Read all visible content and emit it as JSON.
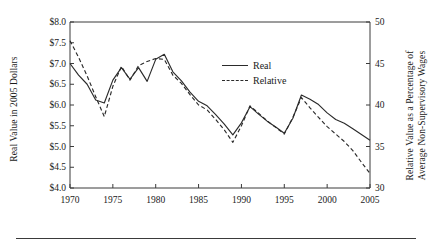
{
  "chart_data": {
    "type": "line",
    "title": "",
    "xlabel": "",
    "ylabel": "Real Value in 2005 Dollars",
    "ylabel_right": "Relative Value as a Percentage of Average Non-Supervisory Wages",
    "xlim": [
      1970,
      2005
    ],
    "ylim": [
      4.0,
      8.0
    ],
    "ylim_right": [
      30,
      50
    ],
    "grid": false,
    "legend_position": "upper-right-inside",
    "y_ticks_left": [
      "$8.0",
      "$7.5",
      "$7.0",
      "$6.5",
      "$6.0",
      "$5.5",
      "$5.0",
      "$4.5",
      "$4.0"
    ],
    "y_tick_values_left": [
      8.0,
      7.5,
      7.0,
      6.5,
      6.0,
      5.5,
      5.0,
      4.5,
      4.0
    ],
    "y_ticks_right": [
      "50",
      "45",
      "40",
      "35",
      "30"
    ],
    "y_tick_values_right": [
      50,
      45,
      40,
      35,
      30
    ],
    "x_ticks": [
      "1970",
      "1975",
      "1980",
      "1985",
      "1990",
      "1995",
      "2000",
      "2005"
    ],
    "x_tick_values": [
      1970,
      1975,
      1980,
      1985,
      1990,
      1995,
      2000,
      2005
    ],
    "x": [
      1970,
      1971,
      1972,
      1973,
      1974,
      1975,
      1976,
      1977,
      1978,
      1979,
      1980,
      1981,
      1982,
      1983,
      1984,
      1985,
      1986,
      1987,
      1988,
      1989,
      1990,
      1991,
      1992,
      1993,
      1994,
      1995,
      1996,
      1997,
      1998,
      1999,
      2000,
      2001,
      2002,
      2003,
      2004,
      2005
    ],
    "series": [
      {
        "name": "Real",
        "style": "solid",
        "axis": "left",
        "values": [
          7.0,
          6.72,
          6.5,
          6.12,
          6.05,
          6.6,
          6.9,
          6.62,
          6.9,
          6.57,
          7.1,
          7.22,
          6.8,
          6.58,
          6.31,
          6.09,
          5.98,
          5.77,
          5.54,
          5.28,
          5.57,
          5.96,
          5.78,
          5.61,
          5.47,
          5.32,
          5.68,
          6.24,
          6.14,
          6.01,
          5.81,
          5.65,
          5.56,
          5.43,
          5.29,
          5.15
        ]
      },
      {
        "name": "Relative",
        "style": "dashed",
        "axis": "left",
        "values": [
          7.55,
          7.15,
          6.7,
          6.2,
          5.72,
          6.45,
          6.93,
          6.6,
          6.95,
          7.05,
          7.12,
          7.1,
          6.72,
          6.52,
          6.25,
          6.0,
          5.88,
          5.65,
          5.4,
          5.1,
          5.5,
          5.98,
          5.8,
          5.62,
          5.46,
          5.3,
          5.7,
          6.18,
          5.93,
          5.7,
          5.48,
          5.3,
          5.12,
          4.9,
          4.62,
          4.35
        ]
      }
    ],
    "series_right_values": {
      "note_axis_mapping": "right axis 30-50 maps linearly onto left axis 4.0-8.0",
      "Real": [
        45.0,
        43.6,
        42.5,
        40.6,
        40.3,
        43.0,
        44.5,
        43.1,
        44.5,
        42.9,
        45.5,
        46.1,
        44.0,
        42.9,
        41.6,
        40.5,
        39.9,
        38.9,
        37.7,
        36.4,
        37.9,
        39.8,
        38.9,
        38.1,
        37.4,
        36.6,
        38.4,
        41.2,
        40.7,
        40.1,
        39.1,
        38.3,
        37.8,
        37.2,
        36.5,
        35.8
      ],
      "Relative": [
        47.8,
        45.8,
        43.5,
        41.0,
        38.6,
        42.3,
        44.7,
        43.0,
        44.8,
        45.3,
        45.6,
        45.5,
        43.6,
        42.6,
        41.3,
        40.0,
        39.4,
        38.3,
        37.0,
        35.5,
        37.5,
        39.9,
        39.0,
        38.1,
        37.3,
        36.5,
        38.5,
        40.9,
        39.7,
        38.5,
        37.4,
        36.5,
        35.6,
        34.5,
        33.1,
        31.8
      ]
    },
    "legend": [
      {
        "label": "Real",
        "style": "solid"
      },
      {
        "label": "Relative",
        "style": "dashed"
      }
    ],
    "colors": {
      "line": "#2b2b2b",
      "axis": "#3a3a3a",
      "text": "#1a1a1a"
    }
  },
  "axes": {
    "left_title": "Real Value in 2005 Dollars",
    "right_title_line1": "Relative Value as a Percentage of",
    "right_title_line2": "Average Non-Supervisory Wages"
  }
}
